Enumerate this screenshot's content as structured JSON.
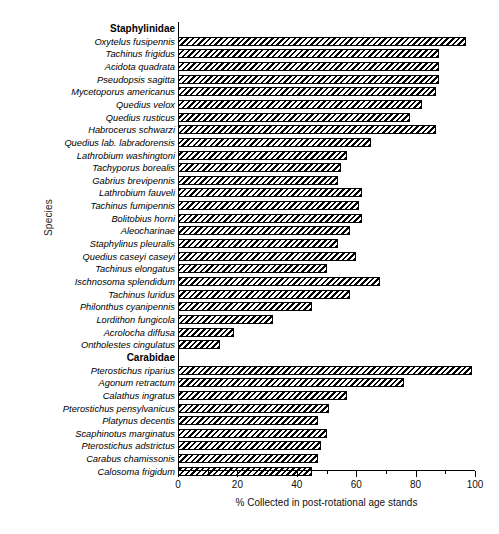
{
  "chart_data": {
    "type": "bar",
    "orientation": "horizontal",
    "title": "",
    "xlabel": "% Collected in post-rotational age stands",
    "ylabel": "Species",
    "xlim": [
      0,
      100
    ],
    "xticks": [
      0,
      20,
      40,
      60,
      80,
      100
    ],
    "xticklabels": [
      "0",
      "20",
      "40",
      "60",
      "80",
      "100"
    ],
    "minor_ticks": [
      10,
      30,
      50,
      70,
      90
    ],
    "grid": false,
    "legend": null,
    "bar_style": "hatched-diagonal",
    "groups": [
      {
        "name": "Staphylinidae",
        "categories": [
          "Oxytelus fusipennis",
          "Tachinus frigidus",
          "Acidota quadrata",
          "Pseudopsis sagitta",
          "Mycetoporus americanus",
          "Quedius velox",
          "Quedius rusticus",
          "Habrocerus schwarzi",
          "Quedius lab. labradorensis",
          "Lathrobium washingtoni",
          "Tachyporus borealis",
          "Gabrius brevipennis",
          "Lathrobium fauveli",
          "Tachinus fumipennis",
          "Bolitobius horni",
          "Aleocharinae",
          "Staphylinus pleuralis",
          "Quedius caseyi caseyi",
          "Tachinus elongatus",
          "Ischnosoma splendidum",
          "Tachinus luridus",
          "Philonthus cyanipennis",
          "Lordithon fungicola",
          "Acrolocha diffusa",
          "Ontholestes cingulatus"
        ],
        "values": [
          97,
          88,
          88,
          88,
          87,
          82,
          78,
          87,
          65,
          57,
          55,
          54,
          62,
          61,
          62,
          58,
          54,
          60,
          50,
          68,
          58,
          45,
          32,
          19,
          14
        ]
      },
      {
        "name": "Carabidae",
        "categories": [
          "Pterostichus riparius",
          "Agonum retractum",
          "Calathus ingratus",
          "Pterostichus pensylvanicus",
          "Platynus decentis",
          "Scaphinotus marginatus",
          "Pterostichus adstrictus",
          "Carabus chamissonis",
          "Calosoma frigidum"
        ],
        "values": [
          99,
          76,
          57,
          51,
          47,
          50,
          48,
          47,
          45
        ]
      }
    ]
  },
  "axis": {
    "ylabel": "Species",
    "xlabel": "% Collected in post-rotational age stands"
  }
}
